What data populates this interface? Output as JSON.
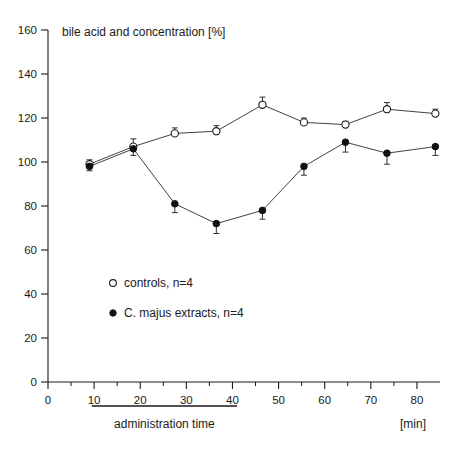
{
  "chart_data": {
    "type": "line",
    "title": "bile acid and concentration [%]",
    "xlabel": "[min]",
    "ylabel": "",
    "xlim": [
      0,
      85
    ],
    "ylim": [
      0,
      160
    ],
    "xticks": [
      0,
      10,
      20,
      30,
      40,
      50,
      60,
      70,
      80
    ],
    "yticks": [
      0,
      20,
      40,
      60,
      80,
      100,
      120,
      140,
      160
    ],
    "minor_xticks": [
      5,
      15,
      25,
      35,
      45,
      55,
      65,
      75
    ],
    "grid": false,
    "legend_position": "center-left",
    "annotations": [
      {
        "name": "administration-time-bar",
        "label": "administration time",
        "x_start": 9.5,
        "x_end": 41
      }
    ],
    "series": [
      {
        "name": "controls, n=4",
        "marker": "open-circle",
        "n": 4,
        "x": [
          9,
          18.5,
          27.5,
          36.5,
          46.5,
          55.5,
          64.5,
          73.5,
          84
        ],
        "y": [
          99,
          107,
          113,
          114,
          126,
          118,
          117,
          124,
          122
        ],
        "yerr": [
          2,
          3.5,
          2.5,
          2.5,
          3.5,
          2,
          1.5,
          3,
          2
        ]
      },
      {
        "name": "C. majus extracts, n=4",
        "marker": "filled-circle",
        "n": 4,
        "x": [
          9,
          18.5,
          27.5,
          36.5,
          46.5,
          55.5,
          64.5,
          73.5,
          84
        ],
        "y": [
          98,
          106,
          81,
          72,
          78,
          98,
          109,
          104,
          107
        ],
        "yerr": [
          2,
          3,
          4,
          4.5,
          4,
          4,
          4.5,
          5,
          4
        ]
      }
    ]
  },
  "legend": {
    "items": [
      {
        "marker": "open-circle",
        "label": "controls, n=4"
      },
      {
        "marker": "filled-circle",
        "label": "C. majus extracts, n=4"
      }
    ]
  },
  "captions": {
    "administration_time": "administration time",
    "x_units": "[min]"
  }
}
